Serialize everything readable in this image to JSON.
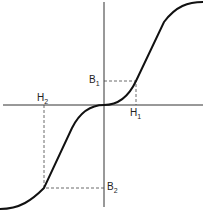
{
  "diagram": {
    "type": "magnetization curve (B vs H)",
    "labels": {
      "B1": "B",
      "B1_sub": "1",
      "H1": "H",
      "H1_sub": "1",
      "H2": "H",
      "H2_sub": "2",
      "B2": "B",
      "B2_sub": "2"
    },
    "colors": {
      "curve": "#111111",
      "axes": "#333333",
      "dashes": "#444444"
    }
  }
}
